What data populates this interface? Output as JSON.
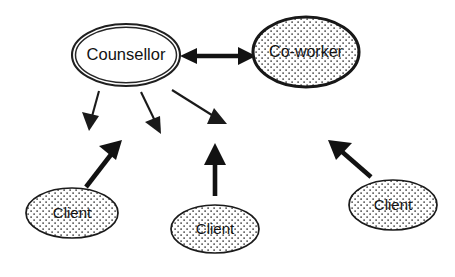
{
  "diagram": {
    "background_color": "#ffffff",
    "line_color": "#1a1a1a",
    "fill_plain_color": "#ffffff",
    "fill_pattern": "dotted-stipple",
    "nodes": [
      {
        "id": "counsellor",
        "label": "Counsellor",
        "shape": "ellipse",
        "style": "double-outline-white",
        "cx": 126,
        "cy": 55,
        "rx": 54,
        "ry": 31
      },
      {
        "id": "coworker",
        "label": "Co-worker",
        "shape": "ellipse",
        "style": "dotted-fill-heavy-outline",
        "cx": 306,
        "cy": 52,
        "rx": 53,
        "ry": 35
      },
      {
        "id": "client-left",
        "label": "Client",
        "shape": "ellipse",
        "style": "dotted-fill",
        "cx": 72,
        "cy": 213,
        "rx": 46,
        "ry": 25
      },
      {
        "id": "client-middle",
        "label": "Client",
        "shape": "ellipse",
        "style": "dotted-fill",
        "cx": 215,
        "cy": 229,
        "rx": 44,
        "ry": 24
      },
      {
        "id": "client-right",
        "label": "Client",
        "shape": "ellipse",
        "style": "dotted-fill",
        "cx": 393,
        "cy": 205,
        "rx": 44,
        "ry": 25
      }
    ],
    "edges": [
      {
        "id": "counsellor-coworker",
        "from": "counsellor",
        "to": "coworker",
        "weight": "thick",
        "direction": "bidirectional"
      },
      {
        "id": "counsellor-to-client-left",
        "from": "counsellor",
        "to": "client-left",
        "weight": "thin",
        "direction": "down-left"
      },
      {
        "id": "counsellor-to-client-middle",
        "from": "counsellor",
        "to": "client-middle",
        "weight": "thin",
        "direction": "down"
      },
      {
        "id": "counsellor-to-client-right",
        "from": "counsellor",
        "to": "client-right",
        "weight": "thin",
        "direction": "down-right"
      },
      {
        "id": "client-left-to-counsellor",
        "from": "client-left",
        "to": "counsellor",
        "weight": "thick",
        "direction": "up-right"
      },
      {
        "id": "client-middle-to-counsellor",
        "from": "client-middle",
        "to": "counsellor",
        "weight": "thick",
        "direction": "up"
      },
      {
        "id": "client-right-to-counsellor",
        "from": "client-right",
        "to": "counsellor",
        "weight": "thick",
        "direction": "up-left"
      }
    ]
  }
}
